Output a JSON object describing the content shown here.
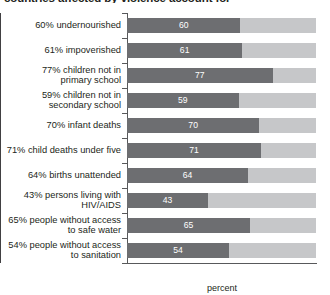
{
  "title": "countries affected by violence account for",
  "chart_data": {
    "type": "bar",
    "orientation": "horizontal",
    "title": "countries affected by violence account for",
    "xlabel": "percent",
    "ylabel": "",
    "xlim": [
      0,
      100
    ],
    "xticks": [
      0,
      50,
      100
    ],
    "xtick_labels": [
      "0",
      "50",
      "100"
    ],
    "grid": false,
    "legend": false,
    "reference_line": 50,
    "track_max": 100,
    "categories": [
      "60% undernourished",
      "61% impoverished",
      "77% children not in primary school",
      "59% children not in secondary school",
      "70% infant deaths",
      "71% child deaths under five",
      "64% births unattended",
      "43% persons living with HIV/AIDS",
      "65% people without access to safe water",
      "54% people without access to sanitation"
    ],
    "values": [
      60,
      61,
      77,
      59,
      70,
      71,
      64,
      43,
      65,
      54
    ],
    "colors": {
      "bar_fill": "#6d6e71",
      "bar_track": "#c6c7c9",
      "value_text": "#ffffff",
      "axis": "#58595b",
      "reference_line": "#414042",
      "text": "#231f20",
      "background": "#ffffff"
    }
  },
  "rows": [
    {
      "label_lines": [
        "60% undernourished"
      ],
      "value": 60,
      "value_label": "60"
    },
    {
      "label_lines": [
        "61% impoverished"
      ],
      "value": 61,
      "value_label": "61"
    },
    {
      "label_lines": [
        "77% children not in",
        "primary school"
      ],
      "value": 77,
      "value_label": "77"
    },
    {
      "label_lines": [
        "59% children not in",
        "secondary school"
      ],
      "value": 59,
      "value_label": "59"
    },
    {
      "label_lines": [
        "70% infant deaths"
      ],
      "value": 70,
      "value_label": "70"
    },
    {
      "label_lines": [
        "71% child deaths under five"
      ],
      "value": 71,
      "value_label": "71"
    },
    {
      "label_lines": [
        "64% births unattended"
      ],
      "value": 64,
      "value_label": "64"
    },
    {
      "label_lines": [
        "43% persons living with",
        "HIV/AIDS"
      ],
      "value": 43,
      "value_label": "43"
    },
    {
      "label_lines": [
        "65% people without access",
        "to safe water"
      ],
      "value": 65,
      "value_label": "65"
    },
    {
      "label_lines": [
        "54% people without access",
        "to sanitation"
      ],
      "value": 54,
      "value_label": "54"
    }
  ],
  "axis": {
    "ticks": [
      "0",
      "50",
      "100"
    ],
    "tick_values": [
      0,
      50,
      100
    ],
    "title": "percent"
  }
}
